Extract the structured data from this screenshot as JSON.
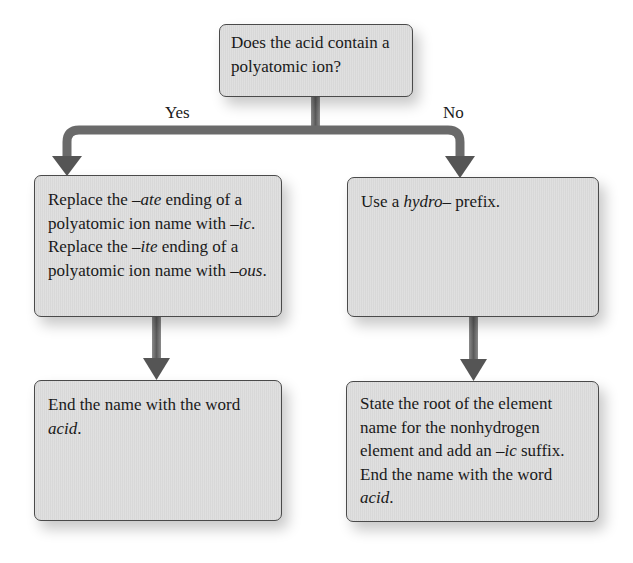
{
  "diagram": {
    "type": "flowchart",
    "colors": {
      "box_fill": "#dcdcdc",
      "box_border": "#4a4a4a",
      "arrow": "#555555",
      "text": "#1a1a1a"
    },
    "question": {
      "line1": "Does the acid contain a",
      "line2": "polyatomic ion?"
    },
    "branches": {
      "yes_label": "Yes",
      "no_label": "No"
    },
    "yes_path": {
      "step1": {
        "t1": "Replace the ",
        "t2": "–ate",
        "t3": " ending of a polyatomic ion name with ",
        "t4": "–ic",
        "t5": ". Replace the ",
        "t6": "–ite",
        "t7": " ending of a polyatomic ion name with ",
        "t8": "–ous",
        "t9": "."
      },
      "step2": {
        "t1": "End the name with the word ",
        "t2": "acid",
        "t3": "."
      }
    },
    "no_path": {
      "step1": {
        "t1": "Use a ",
        "t2": "hydro",
        "t3": "– prefix."
      },
      "step2": {
        "t1": "State the root of the element name for the nonhydrogen element and add an ",
        "t2": "–ic",
        "t3": " suffix. End the name with the word ",
        "t4": "acid",
        "t5": "."
      }
    }
  }
}
